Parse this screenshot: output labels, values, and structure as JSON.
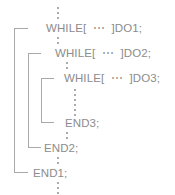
{
  "diagram": {
    "type": "code-nesting-diagram",
    "text_color": "#8c8c8c",
    "bracket_color": "#a9a9a9",
    "dot_color": "#9a9a9a",
    "background": "#ffffff",
    "ellipsis_glyph": "⋯",
    "lines": [
      {
        "id": "while1",
        "text": "WHILE[  ⋯  ]DO1;",
        "level": 1
      },
      {
        "id": "while2",
        "text": "WHILE[  ⋯  ]DO2;",
        "level": 2
      },
      {
        "id": "while3",
        "text": "WHILE[  ⋯  ]DO3;",
        "level": 3
      },
      {
        "id": "end3",
        "text": "END3;",
        "level": 3
      },
      {
        "id": "end2",
        "text": "END2;",
        "level": 2
      },
      {
        "id": "end1",
        "text": "END1;",
        "level": 1
      }
    ],
    "brackets": [
      {
        "id": "bracket-loop-1",
        "label": "DO1..END1 nesting bracket"
      },
      {
        "id": "bracket-loop-2",
        "label": "DO2..END2 nesting bracket"
      },
      {
        "id": "bracket-loop-3",
        "label": "DO3..END3 nesting bracket"
      }
    ],
    "ellipsis_markers": [
      {
        "id": "dots-top",
        "label": "omitted code above WHILE 1"
      },
      {
        "id": "dots-1-2",
        "label": "omitted code between DO1 and DO2"
      },
      {
        "id": "dots-2-3",
        "label": "omitted code between DO2 and DO3"
      },
      {
        "id": "dots-3-end3",
        "label": "omitted code inside loop 3"
      },
      {
        "id": "dots-end3-end2",
        "label": "omitted code between END3 and END2"
      },
      {
        "id": "dots-end2-end1",
        "label": "omitted code between END2 and END1"
      },
      {
        "id": "dots-bottom",
        "label": "omitted code below END1"
      }
    ]
  }
}
